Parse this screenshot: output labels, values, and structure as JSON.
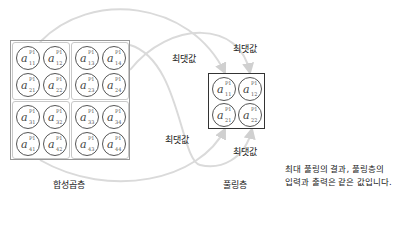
{
  "conv_layer": {
    "label": "합성곱층",
    "superscript": "P1",
    "cells": [
      [
        "11",
        "12",
        "13",
        "14"
      ],
      [
        "21",
        "22",
        "23",
        "24"
      ],
      [
        "31",
        "32",
        "33",
        "34"
      ],
      [
        "41",
        "42",
        "43",
        "44"
      ]
    ]
  },
  "pooling_layer": {
    "label": "풀링층",
    "superscript": "P1",
    "cells": [
      [
        "11",
        "12"
      ],
      [
        "21",
        "22"
      ]
    ]
  },
  "arrows": {
    "max_labels": [
      "최댓값",
      "최댓값",
      "최댓값",
      "최댓값"
    ]
  },
  "note": {
    "line1": "최대 풀링의 결과, 풀링층의",
    "line2": "입력과 출력은 같은 값입니다."
  },
  "colors": {
    "curve": "#d9d9d9",
    "circle": "#555555",
    "pool_border": "#333333"
  }
}
